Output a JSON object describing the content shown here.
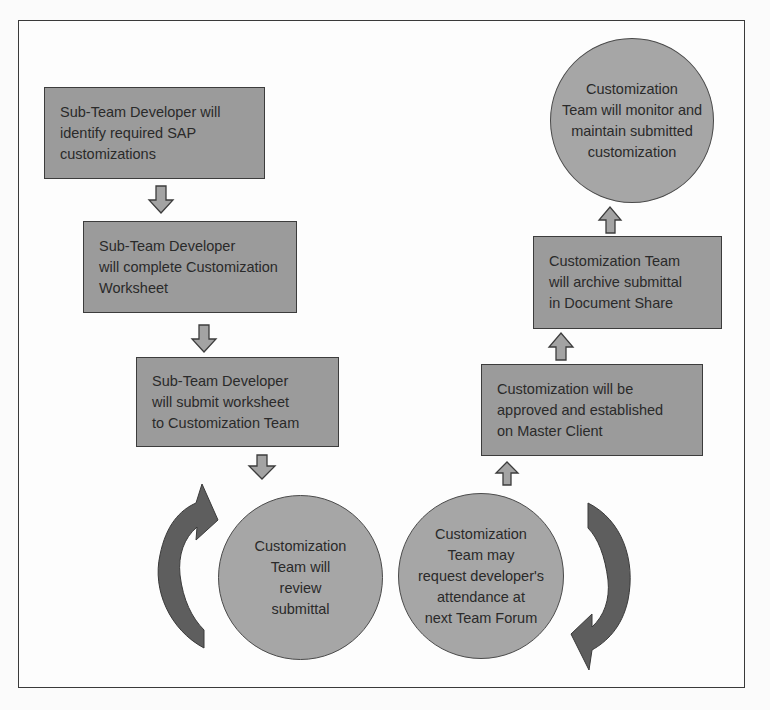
{
  "diagram": {
    "type": "process-flowchart",
    "colors": {
      "box_fill": "#9b9b9b",
      "circle_fill": "#a6a6a6",
      "arrow_fill": "#a3a3a3",
      "curved_arrow_fill": "#5e5e5e",
      "border": "#3c3c3c"
    },
    "steps": [
      {
        "id": 1,
        "shape": "rectangle",
        "text": "Sub-Team Developer will\nidentify required SAP\ncustomizations"
      },
      {
        "id": 2,
        "shape": "rectangle",
        "text": "Sub-Team Developer\nwill complete Customization\nWorksheet"
      },
      {
        "id": 3,
        "shape": "rectangle",
        "text": "Sub-Team Developer\nwill submit worksheet\nto Customization Team"
      },
      {
        "id": 4,
        "shape": "circle",
        "text": "Customization\nTeam will\nreview\nsubmittal"
      },
      {
        "id": 5,
        "shape": "circle",
        "text": "Customization\nTeam may\nrequest developer's\nattendance at\nnext Team Forum"
      },
      {
        "id": 6,
        "shape": "rectangle",
        "text": "Customization will be\napproved and established\non Master Client"
      },
      {
        "id": 7,
        "shape": "rectangle",
        "text": "Customization Team\nwill archive submittal\nin Document Share"
      },
      {
        "id": 8,
        "shape": "circle",
        "text": "Customization\nTeam will monitor and\nmaintain submitted\ncustomization"
      }
    ],
    "connectors": [
      {
        "from": 1,
        "to": 2,
        "icon": "down-arrow-icon"
      },
      {
        "from": 2,
        "to": 3,
        "icon": "down-arrow-icon"
      },
      {
        "from": 3,
        "to": 4,
        "icon": "down-arrow-icon"
      },
      {
        "from": 4,
        "to": 5,
        "icon": "curved-cycle-arrow-icon"
      },
      {
        "from": 5,
        "to": 6,
        "icon": "up-arrow-icon"
      },
      {
        "from": 6,
        "to": 7,
        "icon": "up-arrow-icon"
      },
      {
        "from": 7,
        "to": 8,
        "icon": "up-arrow-icon"
      }
    ]
  }
}
